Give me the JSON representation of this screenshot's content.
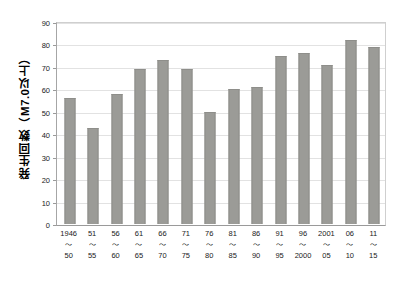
{
  "chart_data": {
    "type": "bar",
    "title": "",
    "subtitle": "",
    "xlabel": "",
    "ylabel": "発生回数（M7.0以上）",
    "ylim": [
      0,
      90
    ],
    "ytick_step": 10,
    "yticks": [
      "0",
      "10",
      "20",
      "30",
      "40",
      "50",
      "60",
      "70",
      "80",
      "90"
    ],
    "grid": true,
    "legend": false,
    "bar_color": "#9b9b97",
    "gridline_color": "#e2e2e2",
    "axis_color": "#9a9a9a",
    "categories": [
      "1946\n～\n50",
      "51\n～\n55",
      "56\n～\n60",
      "61\n～\n65",
      "66\n～\n70",
      "71\n～\n75",
      "76\n～\n80",
      "81\n～\n85",
      "86\n～\n90",
      "91\n～\n95",
      "96\n～\n2000",
      "2001\n～\n05",
      "06\n～\n10",
      "11\n～\n15"
    ],
    "category_parts": [
      {
        "start": "1946",
        "tilde": "～",
        "end": "50"
      },
      {
        "start": "51",
        "tilde": "～",
        "end": "55"
      },
      {
        "start": "56",
        "tilde": "～",
        "end": "60"
      },
      {
        "start": "61",
        "tilde": "～",
        "end": "65"
      },
      {
        "start": "66",
        "tilde": "～",
        "end": "70"
      },
      {
        "start": "71",
        "tilde": "～",
        "end": "75"
      },
      {
        "start": "76",
        "tilde": "～",
        "end": "80"
      },
      {
        "start": "81",
        "tilde": "～",
        "end": "85"
      },
      {
        "start": "86",
        "tilde": "～",
        "end": "90"
      },
      {
        "start": "91",
        "tilde": "～",
        "end": "95"
      },
      {
        "start": "96",
        "tilde": "～",
        "end": "2000"
      },
      {
        "start": "2001",
        "tilde": "～",
        "end": "05"
      },
      {
        "start": "06",
        "tilde": "～",
        "end": "10"
      },
      {
        "start": "11",
        "tilde": "～",
        "end": "15"
      }
    ],
    "values": [
      56,
      43,
      58,
      69,
      73,
      69,
      50,
      60,
      61,
      75,
      76,
      71,
      82,
      79
    ]
  }
}
